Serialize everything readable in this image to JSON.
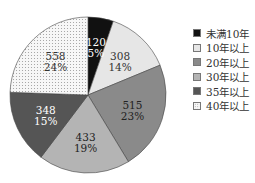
{
  "chart_data": {
    "type": "pie",
    "title": "",
    "categories": [
      "未满10年",
      "10年以上",
      "20年以上",
      "30年以上",
      "35年以上",
      "40年以上"
    ],
    "values": [
      120,
      308,
      515,
      433,
      348,
      558
    ],
    "percent_labels": [
      "5%",
      "14%",
      "23%",
      "19%",
      "15%",
      "24%"
    ],
    "colors": [
      "#111111",
      "#e6e6e6",
      "#8a8a8a",
      "#b4b4b4",
      "#555555",
      "#f4f4f4"
    ],
    "label_colors": [
      "#ffffff",
      "#333333",
      "#222222",
      "#222222",
      "#ffffff",
      "#333333"
    ],
    "patterns": [
      "solid",
      "solid",
      "solid",
      "solid",
      "solid",
      "dotted"
    ],
    "start_angle": 0,
    "direction": "clockwise",
    "legend_position": "right"
  },
  "legend": {
    "items": [
      {
        "label": "未满10年"
      },
      {
        "label": "10年以上"
      },
      {
        "label": "20年以上"
      },
      {
        "label": "30年以上"
      },
      {
        "label": "35年以上"
      },
      {
        "label": "40年以上"
      }
    ]
  }
}
